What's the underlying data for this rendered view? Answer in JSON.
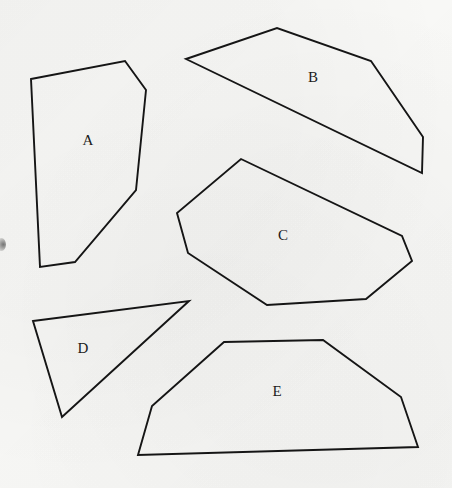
{
  "page": {
    "width": 452,
    "height": 488,
    "background_color": "#f8f8f6",
    "stroke_color": "#151515",
    "label_color": "#1b1b1b"
  },
  "figure": {
    "shapes": [
      {
        "id": "shape-a",
        "label": "A",
        "sides": 6,
        "label_x": 88,
        "label_y": 140,
        "points": "31,79 125,61 146,90 136,190 75,262 40,267"
      },
      {
        "id": "shape-b",
        "label": "B",
        "sides": 5,
        "label_x": 313,
        "label_y": 77,
        "points": "186,59 277,28 371,61 423,137 422,173"
      },
      {
        "id": "shape-c",
        "label": "C",
        "sides": 7,
        "label_x": 283,
        "label_y": 235,
        "points": "241,159 402,236 412,261 366,299 267,305 188,253 177,213"
      },
      {
        "id": "shape-d",
        "label": "D",
        "sides": 3,
        "label_x": 83,
        "label_y": 348,
        "points": "33,321 189,301 62,417"
      },
      {
        "id": "shape-e",
        "label": "E",
        "sides": 6,
        "label_x": 277,
        "label_y": 391,
        "points": "224,342 323,340 401,397 418,447 138,455 152,406"
      }
    ],
    "marks": [
      {
        "id": "left-edge-smudge",
        "x": 0,
        "y": 238
      }
    ]
  }
}
